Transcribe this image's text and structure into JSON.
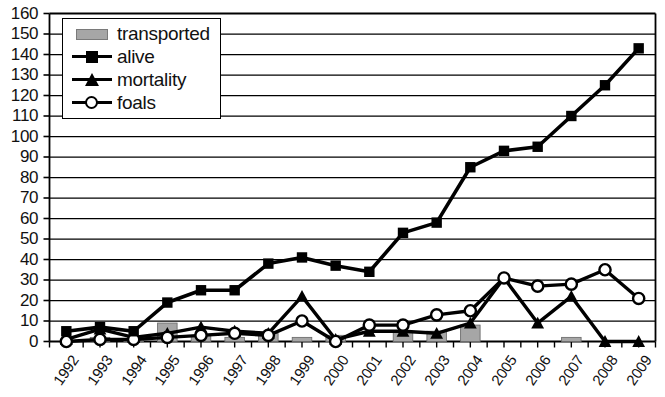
{
  "chart_data": {
    "type": "line",
    "title": "",
    "xlabel": "",
    "ylabel": "",
    "ylim": [
      0,
      160
    ],
    "ytick_step": 10,
    "grid": true,
    "legend_position": "top-left",
    "categories": [
      "1992",
      "1993",
      "1994",
      "1995",
      "1996",
      "1997",
      "1998",
      "1999",
      "2000",
      "2001",
      "2002",
      "2003",
      "2004",
      "2005",
      "2006",
      "2007",
      "2008",
      "2009"
    ],
    "yticks": [
      "160",
      "150",
      "140",
      "130",
      "120",
      "110",
      "100",
      "90",
      "80",
      "70",
      "60",
      "50",
      "40",
      "30",
      "20",
      "10",
      "0"
    ],
    "series": [
      {
        "name": "transported",
        "type": "bar",
        "color": "#a6a6a6",
        "values": [
          0,
          2,
          1,
          9,
          3,
          2,
          4,
          2,
          3,
          0,
          5,
          5,
          8,
          0,
          0,
          2,
          0,
          0
        ]
      },
      {
        "name": "alive",
        "type": "line",
        "marker": "square",
        "color": "#000000",
        "values": [
          5,
          7,
          5,
          19,
          25,
          25,
          38,
          41,
          37,
          34,
          53,
          58,
          85,
          93,
          95,
          110,
          125,
          143
        ]
      },
      {
        "name": "mortality",
        "type": "line",
        "marker": "triangle",
        "color": "#000000",
        "values": [
          1,
          6,
          2,
          4,
          7,
          5,
          4,
          22,
          1,
          5,
          5,
          4,
          9,
          31,
          9,
          22,
          0,
          0
        ]
      },
      {
        "name": "foals",
        "type": "line",
        "marker": "circle-open",
        "color": "#000000",
        "values": [
          0,
          1,
          1,
          2,
          3,
          4,
          3,
          10,
          0,
          8,
          8,
          13,
          15,
          31,
          27,
          28,
          35,
          21
        ]
      }
    ]
  },
  "legend": {
    "items": [
      {
        "label": "transported",
        "key": "bar-swatch-icon"
      },
      {
        "label": "alive",
        "key": "square-marker-icon"
      },
      {
        "label": "mortality",
        "key": "triangle-marker-icon"
      },
      {
        "label": "foals",
        "key": "circle-marker-icon"
      }
    ]
  }
}
